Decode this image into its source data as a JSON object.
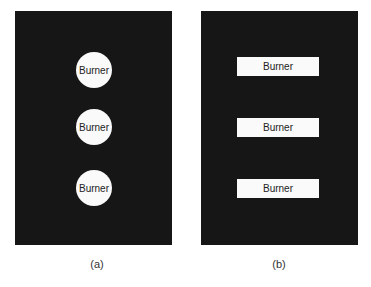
{
  "panels": [
    {
      "id": "a",
      "caption": "(a)",
      "shape": "circle",
      "burners": [
        {
          "label": "Burner"
        },
        {
          "label": "Burner"
        },
        {
          "label": "Burner"
        }
      ]
    },
    {
      "id": "b",
      "caption": "(b)",
      "shape": "rectangle",
      "burners": [
        {
          "label": "Burner"
        },
        {
          "label": "Burner"
        },
        {
          "label": "Burner"
        }
      ]
    }
  ],
  "colors": {
    "panel_background": "#161616",
    "burner_fill": "#fafafa",
    "text": "#222222"
  }
}
